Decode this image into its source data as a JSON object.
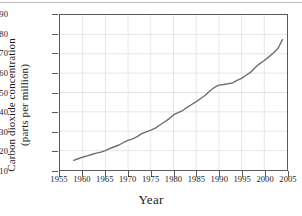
{
  "figure": {
    "top_rule": true,
    "frame_color": "#555a5e",
    "grid_color": "#e6e6e6",
    "line_color": "#6e6e72",
    "background": "#ffffff"
  },
  "chart_data": {
    "type": "line",
    "title": "",
    "xlabel": "Year",
    "ylabel_line1": "Carbon dioxide concentration",
    "ylabel_line2": "(parts per million)",
    "xlim": [
      1955,
      2005
    ],
    "ylim": [
      310,
      390
    ],
    "xticks": [
      1955,
      1960,
      1965,
      1970,
      1975,
      1980,
      1985,
      1990,
      1995,
      2000,
      2005
    ],
    "yticks": [
      310,
      320,
      330,
      340,
      350,
      360,
      370,
      380,
      390
    ],
    "xtick_labels": [
      "1955",
      "1960",
      "1965",
      "1970",
      "1975",
      "1980",
      "1985",
      "1990",
      "1995",
      "2000",
      "2005"
    ],
    "ytick_labels": [
      "310",
      "320",
      "330",
      "340",
      "350",
      "360",
      "370",
      "380",
      "390"
    ],
    "grid": true,
    "legend": "none",
    "series": [
      {
        "name": "Carbon dioxide concentration",
        "x": [
          1958,
          1959,
          1960,
          1961,
          1962,
          1963,
          1964,
          1965,
          1966,
          1967,
          1968,
          1969,
          1970,
          1971,
          1972,
          1973,
          1974,
          1975,
          1976,
          1977,
          1978,
          1979,
          1980,
          1981,
          1982,
          1983,
          1984,
          1985,
          1986,
          1987,
          1988,
          1989,
          1990,
          1991,
          1992,
          1993,
          1994,
          1995,
          1996,
          1997,
          1998,
          1999,
          2000,
          2001,
          2002,
          2003,
          2004
        ],
        "values": [
          315.0,
          315.8,
          316.6,
          317.3,
          318.0,
          318.7,
          319.2,
          320.0,
          321.1,
          322.0,
          322.9,
          324.2,
          325.3,
          326.1,
          327.2,
          328.8,
          329.7,
          330.6,
          331.6,
          333.2,
          334.8,
          336.4,
          338.4,
          339.6,
          340.7,
          342.3,
          343.8,
          345.3,
          346.9,
          348.6,
          350.8,
          352.6,
          353.8,
          354.1,
          354.5,
          355.0,
          356.2,
          357.3,
          358.9,
          360.5,
          362.9,
          364.9,
          366.5,
          368.4,
          370.4,
          372.7,
          377.3
        ]
      }
    ]
  }
}
